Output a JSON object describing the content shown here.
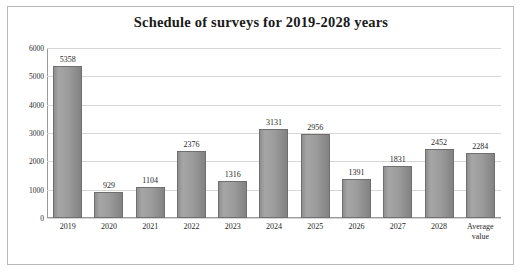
{
  "chart_data": {
    "type": "bar",
    "title": "Schedule of surveys for 2019-2028 years",
    "xlabel": "",
    "ylabel": "",
    "ylim": [
      0,
      6000
    ],
    "ytick_step": 1000,
    "yticks": [
      "0",
      "1000",
      "2000",
      "3000",
      "4000",
      "5000",
      "6000"
    ],
    "grid": true,
    "legend": false,
    "bar_color": "#9b9b9b",
    "bar_border_color": "#6f6f6f",
    "categories": [
      "2019",
      "2020",
      "2021",
      "2022",
      "2023",
      "2024",
      "2025",
      "2026",
      "2027",
      "2028",
      "Average value"
    ],
    "category_lines": [
      [
        "2019"
      ],
      [
        "2020"
      ],
      [
        "2021"
      ],
      [
        "2022"
      ],
      [
        "2023"
      ],
      [
        "2024"
      ],
      [
        "2025"
      ],
      [
        "2026"
      ],
      [
        "2027"
      ],
      [
        "2028"
      ],
      [
        "Average",
        "value"
      ]
    ],
    "values": [
      5358,
      929,
      1104,
      2376,
      1316,
      3131,
      2956,
      1391,
      1831,
      2452,
      2284
    ],
    "data_labels": [
      "5358",
      "929",
      "1104",
      "2376",
      "1316",
      "3131",
      "2956",
      "1391",
      "1831",
      "2452",
      "2284"
    ]
  }
}
